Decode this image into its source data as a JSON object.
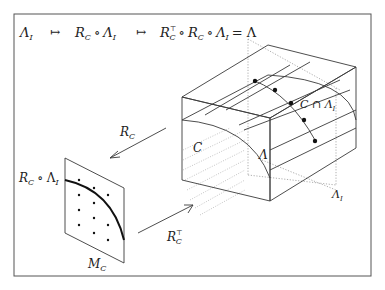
{
  "header": {
    "formula_parts": [
      "Λ_I",
      "↦",
      "R_C ∘ Λ_I",
      "↦",
      "R_C^⊤ ∘ R_C ∘ Λ_I = Λ"
    ],
    "lambda": "Λ",
    "sub_I": "I",
    "sub_C": "C",
    "mapsto": "↦",
    "circ": "∘",
    "R": "R",
    "transpose": "⊤",
    "equals_lambda": "= Λ"
  },
  "labels": {
    "R_C_arrow": "R",
    "R_C_arrow_sub": "C",
    "R_CT_arrow": "R",
    "R_CT_arrow_sub": "C",
    "R_CT_arrow_sup": "⊤",
    "plane_curve_R": "R",
    "plane_curve_sub": "C",
    "plane_curve_rest": "∘ Λ",
    "plane_curve_rest_sub": "I",
    "plane_name": "M",
    "plane_name_sub": "C",
    "region_C": "C",
    "lattice_Lambda": "Λ",
    "lambda_I": "Λ",
    "lambda_I_sub": "I",
    "intersection": "C ∩ Λ",
    "intersection_sub": "I"
  },
  "colors": {
    "border": "#555555",
    "line": "#3a3a3a",
    "dotted": "#999999",
    "background": "#ffffff"
  }
}
